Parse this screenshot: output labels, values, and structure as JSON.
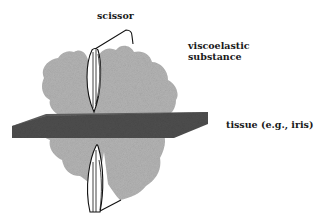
{
  "diagram": {
    "labels": {
      "scissor": "scissor",
      "viscoelastic_line1": "viscoelastic",
      "viscoelastic_line2": "substance",
      "tissue": "tissue (e.g., iris)"
    },
    "elements": {
      "scissor": "scissor blades (upper and lower) with connecting hinge line",
      "viscoelastic": "grey stippled irregular blob surrounding tissue",
      "tissue": "dark grey slab in perspective"
    },
    "colors": {
      "background": "#ffffff",
      "viscoelastic": "#b4b4b4",
      "tissue": "#4e4e4e",
      "tissue_edge": "#3a3a3a",
      "outline": "#111111",
      "text": "#1a1a1a"
    }
  }
}
